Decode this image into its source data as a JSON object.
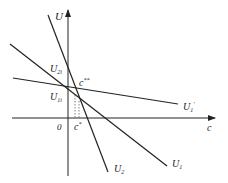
{
  "diagram": {
    "axes": {
      "y_label": "U",
      "x_label": "c",
      "origin_label": "0"
    },
    "lines": [
      {
        "name": "U1",
        "label": "U",
        "sub": "1",
        "x1": 10,
        "y1": 44,
        "x2": 167,
        "y2": 166
      },
      {
        "name": "U2",
        "label": "U",
        "sub": "2",
        "x1": 48,
        "y1": 15,
        "x2": 108,
        "y2": 172
      },
      {
        "name": "U1-prime",
        "label": "U",
        "sub": "1",
        "sup": "'",
        "x1": 13,
        "y1": 78,
        "x2": 178,
        "y2": 104
      }
    ],
    "point_labels": {
      "u2i": {
        "main": "U",
        "sub": "2i"
      },
      "u1i": {
        "main": "U",
        "sub": "1i"
      },
      "c_double_star": {
        "main": "c",
        "sup": "**"
      },
      "c_star": {
        "main": "c",
        "sup": "*"
      }
    },
    "stroke_color": "#222222"
  }
}
